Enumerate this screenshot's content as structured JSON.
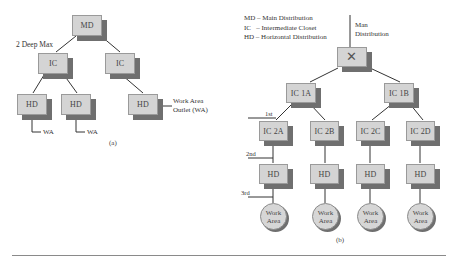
{
  "diagram_a": {
    "caption": "(a)",
    "depth_label": "2 Deep Max",
    "root": "MD",
    "level1": [
      "IC",
      "IC"
    ],
    "level2": [
      "HD",
      "HD",
      "HD"
    ],
    "outlet_labels": [
      "WA",
      "WA"
    ],
    "outlet_note_line1": "Work Area",
    "outlet_note_line2": "Outlet (WA)"
  },
  "diagram_b": {
    "caption": "(b)",
    "legend": [
      "MD – Main Distribution",
      "IC   – Intermediate Closet",
      "HD – Horizontal Distribution"
    ],
    "root_symbol": "✕",
    "root_note_line1": "Man",
    "root_note_line2": "Distribution",
    "level1": [
      "IC 1A",
      "IC 1B"
    ],
    "level2": [
      "IC 2A",
      "IC 2B",
      "IC 2C",
      "IC 2D"
    ],
    "level3": [
      "HD",
      "HD",
      "HD",
      "HD"
    ],
    "work_areas": [
      {
        "line1": "Work",
        "line2": "Area"
      },
      {
        "line1": "Work",
        "line2": "Area"
      },
      {
        "line1": "Work",
        "line2": "Area"
      },
      {
        "line1": "Work",
        "line2": "Area"
      }
    ],
    "level_markers": [
      "1st",
      "2nd",
      "3rd"
    ]
  },
  "colors": {
    "box_face": "#d4d4d4",
    "box_shadow": "#6f6f6f",
    "line": "#333333",
    "rule": "#8a8a8a"
  }
}
